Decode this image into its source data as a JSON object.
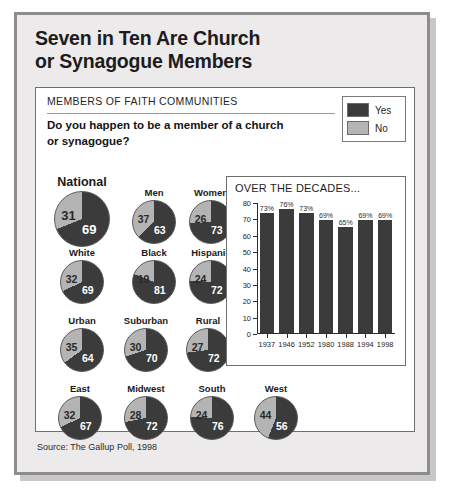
{
  "headline": {
    "line1": "Seven in Ten Are Church",
    "line2": "or Synagogue Members"
  },
  "card": {
    "kicker": "MEMBERS OF FAITH COMMUNITIES",
    "question_line1": "Do you happen to be a member of a church",
    "question_line2": "or synagogue?"
  },
  "legend": {
    "yes_label": "Yes",
    "no_label": "No",
    "yes_color": "#3b3b3b",
    "no_color": "#b4b4b4"
  },
  "chart_data": [
    {
      "type": "pie",
      "title": "Do you happen to be a member of a church or synagogue?",
      "legend": [
        "Yes",
        "No"
      ],
      "legend_position": "top-right",
      "unit": "percent",
      "groups": [
        {
          "label": "National",
          "yes": 69,
          "no": 31
        },
        {
          "label": "Men",
          "yes": 63,
          "no": 37
        },
        {
          "label": "Women",
          "yes": 73,
          "no": 26
        },
        {
          "label": "White",
          "yes": 69,
          "no": 32
        },
        {
          "label": "Black",
          "yes": 81,
          "no": 19
        },
        {
          "label": "Hispanic",
          "yes": 72,
          "no": 24
        },
        {
          "label": "Urban",
          "yes": 64,
          "no": 35
        },
        {
          "label": "Suburban",
          "yes": 70,
          "no": 30
        },
        {
          "label": "Rural",
          "yes": 72,
          "no": 27
        },
        {
          "label": "East",
          "yes": 67,
          "no": 32
        },
        {
          "label": "Midwest",
          "yes": 72,
          "no": 28
        },
        {
          "label": "South",
          "yes": 76,
          "no": 24
        },
        {
          "label": "West",
          "yes": 56,
          "no": 44
        }
      ]
    },
    {
      "type": "bar",
      "title": "OVER THE DECADES...",
      "xlabel": "",
      "ylabel": "",
      "ylim": [
        0,
        80
      ],
      "yticks": [
        0,
        10,
        20,
        30,
        40,
        50,
        60,
        70,
        80
      ],
      "grid": false,
      "categories": [
        "1937",
        "1946",
        "1952",
        "1980",
        "1988",
        "1994",
        "1998"
      ],
      "values": [
        73,
        76,
        73,
        69,
        65,
        69,
        69
      ],
      "data_labels": [
        "73%",
        "76%",
        "73%",
        "69%",
        "65%",
        "69%",
        "69%"
      ],
      "bar_color": "#3b3b3b"
    }
  ],
  "source": "Source: The Gallup Poll, 1998"
}
